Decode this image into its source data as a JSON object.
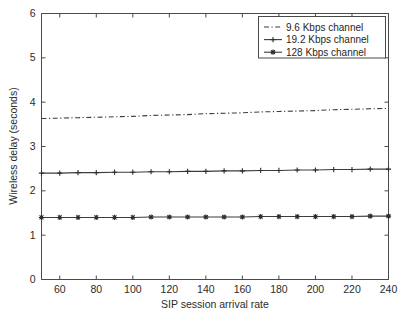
{
  "chart_data": {
    "type": "line",
    "title": "",
    "xlabel": "SIP session arrival rate",
    "ylabel": "Wireless delay (seconds)",
    "xlim": [
      50,
      240
    ],
    "ylim": [
      0,
      6
    ],
    "xticks": [
      60,
      80,
      100,
      120,
      140,
      160,
      180,
      200,
      220,
      240
    ],
    "yticks": [
      0,
      1,
      2,
      3,
      4,
      5,
      6
    ],
    "grid": false,
    "legend_position": "top-right",
    "x": [
      50,
      60,
      70,
      80,
      90,
      100,
      110,
      120,
      130,
      140,
      150,
      160,
      170,
      180,
      190,
      200,
      210,
      220,
      230,
      240
    ],
    "series": [
      {
        "name": "9.6 Kbps channel",
        "line_style": "dash-dot",
        "marker": "none",
        "values": [
          3.63,
          3.64,
          3.65,
          3.66,
          3.67,
          3.68,
          3.7,
          3.71,
          3.72,
          3.74,
          3.75,
          3.76,
          3.78,
          3.79,
          3.8,
          3.81,
          3.83,
          3.84,
          3.85,
          3.86
        ]
      },
      {
        "name": "19.2 Kbps channel",
        "line_style": "solid",
        "marker": "plus",
        "values": [
          2.4,
          2.4,
          2.41,
          2.41,
          2.42,
          2.42,
          2.43,
          2.43,
          2.44,
          2.44,
          2.45,
          2.45,
          2.46,
          2.46,
          2.47,
          2.47,
          2.48,
          2.48,
          2.49,
          2.49
        ]
      },
      {
        "name": "128 Kbps channel",
        "line_style": "solid",
        "marker": "asterisk",
        "values": [
          1.4,
          1.4,
          1.4,
          1.4,
          1.4,
          1.4,
          1.41,
          1.41,
          1.41,
          1.41,
          1.41,
          1.41,
          1.42,
          1.42,
          1.42,
          1.42,
          1.42,
          1.42,
          1.43,
          1.43
        ]
      }
    ]
  },
  "legend": {
    "entries": [
      {
        "label": "9.6 Kbps channel"
      },
      {
        "label": "19.2 Kbps channel"
      },
      {
        "label": "128 Kbps channel"
      }
    ]
  },
  "colors": {
    "line": "#3d3d3d",
    "axis": "#4a4a4a",
    "text": "#1f1f1f",
    "background": "#ffffff"
  }
}
